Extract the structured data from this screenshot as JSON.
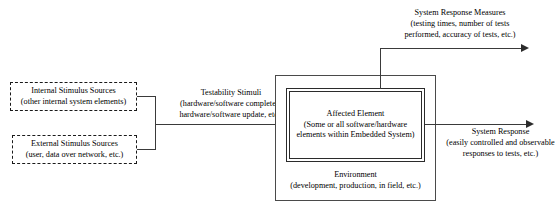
{
  "diagram": {
    "colors": {
      "line": "#3a3a3a",
      "box_border": "#2b2b2b",
      "env_border": "#4a4a4a",
      "dashed_border": "#1a1a1a",
      "background": "#ffffff"
    }
  },
  "sources": {
    "internal": {
      "line1": "Internal Stimulus Sources",
      "line2": "(other internal system elements)"
    },
    "external": {
      "line1": "External Stimulus Sources",
      "line2": "(user, data over network, etc.)"
    }
  },
  "stimuli_label": {
    "line1": "Testability Stimuli",
    "line2": "(hardware/software completed,",
    "line3": "hardware/software update, etc.)"
  },
  "environment": {
    "line1": "Environment",
    "line2": "(development, production, in field, etc.)"
  },
  "affected_element": {
    "line1": "Affected Element",
    "line2": "(Some or all software/hardware",
    "line3": "elements within Embedded System)"
  },
  "response_measures": {
    "line1": "System Response Measures",
    "line2": "(testing times, number of tests",
    "line3": "performed, accuracy of tests, etc.)"
  },
  "system_response": {
    "line1": "System Response",
    "line2": "(easily controlled and observable",
    "line3": "responses to tests, etc.)"
  }
}
